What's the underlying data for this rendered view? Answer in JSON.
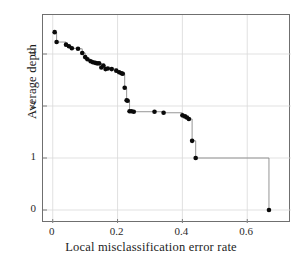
{
  "chart_data": {
    "type": "line",
    "title": "",
    "subtitle": "",
    "xlabel": "Local misclassification error rate",
    "ylabel": "Average depth",
    "xlim": [
      -0.03,
      0.735
    ],
    "ylim": [
      -0.25,
      3.75
    ],
    "xticks": [
      0,
      0.2,
      0.4,
      0.6
    ],
    "xtick_labels": [
      "0",
      "0.2",
      "0.4",
      "0.6"
    ],
    "yticks": [
      0,
      1,
      2,
      3
    ],
    "ytick_labels": [
      "0",
      "1",
      "2",
      "3"
    ],
    "grid": true,
    "grid_color": "#d9d9d9",
    "legend": "none",
    "marker": "filled-circle",
    "marker_color": "#0a0a0a",
    "marker_size": 4.6,
    "line_color": "#8a8a8a",
    "line_width": 0.9,
    "line_style": "step-post",
    "series": [
      {
        "name": "Average depth vs local misclassification error rate",
        "x": [
          0.006,
          0.012,
          0.041,
          0.05,
          0.059,
          0.078,
          0.091,
          0.1,
          0.107,
          0.117,
          0.124,
          0.131,
          0.137,
          0.143,
          0.15,
          0.156,
          0.163,
          0.17,
          0.182,
          0.196,
          0.205,
          0.212,
          0.216,
          0.222,
          0.228,
          0.231,
          0.237,
          0.243,
          0.25,
          0.314,
          0.342,
          0.4,
          0.408,
          0.414,
          0.42,
          0.43,
          0.441,
          0.667
        ],
        "y": [
          3.42,
          3.23,
          3.18,
          3.15,
          3.11,
          3.1,
          3.02,
          2.94,
          2.9,
          2.86,
          2.84,
          2.83,
          2.82,
          2.82,
          2.74,
          2.78,
          2.71,
          2.72,
          2.71,
          2.68,
          2.65,
          2.63,
          2.62,
          2.35,
          2.11,
          2.1,
          1.9,
          1.9,
          1.89,
          1.89,
          1.87,
          1.82,
          1.8,
          1.78,
          1.75,
          1.33,
          1.0,
          0.0
        ]
      }
    ]
  },
  "axes": {
    "x_title": "Local misclassification error rate",
    "y_title": "Average depth"
  }
}
